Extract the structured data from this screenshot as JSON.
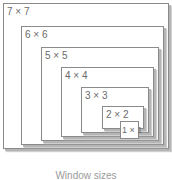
{
  "diagram": {
    "boxes": [
      {
        "label": "7 × 7"
      },
      {
        "label": "6 × 6"
      },
      {
        "label": "5 × 5"
      },
      {
        "label": "4 × 4"
      },
      {
        "label": "3 × 3"
      },
      {
        "label": "2 × 2"
      },
      {
        "label": "1 × 1"
      }
    ],
    "caption": "Window sizes"
  }
}
